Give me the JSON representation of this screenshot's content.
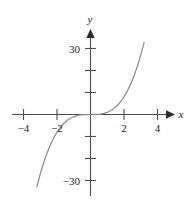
{
  "figure": {
    "background_color": "#ffffff",
    "curve_color": "#8c8c8c",
    "axis_color": "#4d4d4d",
    "text_color": "#222222"
  },
  "axes": {
    "x_name": "x",
    "y_name": "y",
    "x_tick_labels": [
      "−4",
      "−2",
      "2",
      "4"
    ],
    "y_tick_labels": [
      "30",
      "−30"
    ]
  },
  "chart_data": {
    "type": "line",
    "title": "",
    "xlabel": "x",
    "ylabel": "y",
    "xlim": [
      -5.0,
      5.0
    ],
    "ylim": [
      -38,
      38
    ],
    "grid": false,
    "legend": null,
    "function": "y = x^3",
    "x_ticks": [
      -4,
      -2,
      2,
      4
    ],
    "x_tick_labels": [
      "−4",
      "−2",
      "2",
      "4"
    ],
    "y_ticks": [
      -30,
      -20,
      -10,
      10,
      20,
      30
    ],
    "y_tick_labels_shown": {
      "30": "30",
      "-30": "−30"
    },
    "series": [
      {
        "name": "y = x^3",
        "color": "#8c8c8c",
        "x": [
          -3.2,
          -3.0,
          -2.8,
          -2.6,
          -2.4,
          -2.2,
          -2.0,
          -1.8,
          -1.6,
          -1.4,
          -1.2,
          -1.0,
          -0.8,
          -0.6,
          -0.4,
          -0.2,
          0.0,
          0.2,
          0.4,
          0.6,
          0.8,
          1.0,
          1.2,
          1.4,
          1.6,
          1.8,
          2.0,
          2.2,
          2.4,
          2.6,
          2.8,
          3.0,
          3.2
        ],
        "y": [
          -32.77,
          -27.0,
          -21.95,
          -17.58,
          -13.82,
          -10.65,
          -8.0,
          -5.83,
          -4.1,
          -2.74,
          -1.73,
          -1.0,
          -0.51,
          -0.22,
          -0.06,
          -0.01,
          0.0,
          0.01,
          0.06,
          0.22,
          0.51,
          1.0,
          1.73,
          2.74,
          4.1,
          5.83,
          8.0,
          10.65,
          13.82,
          17.58,
          21.95,
          27.0,
          32.77
        ]
      }
    ]
  }
}
